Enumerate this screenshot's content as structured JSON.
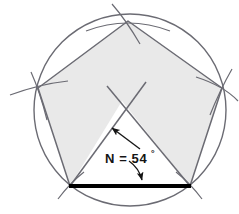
{
  "figure": {
    "annotation": {
      "label": "N = 54",
      "degree_symbol": "°",
      "full_label": "N = 54°",
      "angle_value": 54,
      "angle_unit": "degrees",
      "variable_name": "N"
    },
    "colors": {
      "background": "#ffffff",
      "polygon_fill": "#e9e9e9",
      "polygon_stroke": "#6b6b73",
      "circle_stroke": "#6b6b73",
      "arc_stroke": "#6b6b73",
      "base_line": "#000000",
      "annotation": "#141414",
      "cutout_fill": "#ffffff"
    },
    "circle": {
      "center_x": 130,
      "center_y": 110,
      "radius": 96
    },
    "pentagon": {
      "sides": 5,
      "vertices": [
        {
          "name": "top",
          "x": 128,
          "y": 21
        },
        {
          "name": "right",
          "x": 222,
          "y": 88
        },
        {
          "name": "bottom-right",
          "x": 190,
          "y": 186
        },
        {
          "name": "bottom-left",
          "x": 70,
          "y": 186
        },
        {
          "name": "left",
          "x": 38,
          "y": 88
        }
      ]
    },
    "cutout_triangle": {
      "apex_x": 122,
      "apex_y": 101,
      "left_x": 70,
      "left_y": 186,
      "right_x": 190,
      "right_y": 186
    },
    "construction_lines": [
      {
        "name": "left-diagonal",
        "x1": 70,
        "y1": 186,
        "x2": 145,
        "y2": 83
      },
      {
        "name": "right-diagonal",
        "x1": 190,
        "y1": 186,
        "x2": 108,
        "y2": 88
      }
    ],
    "base_line": {
      "x1": 70,
      "y1": 186,
      "x2": 190,
      "y2": 186,
      "thickness": 4
    },
    "leader_arrows": [
      {
        "name": "upper-arrow",
        "from_x": 139,
        "from_y": 148,
        "to_x": 111,
        "to_y": 127
      },
      {
        "name": "lower-arrow",
        "from_x": 130,
        "from_y": 160,
        "to_x": 142,
        "to_y": 183
      }
    ],
    "label_position": {
      "x": 105,
      "y": 163
    }
  }
}
